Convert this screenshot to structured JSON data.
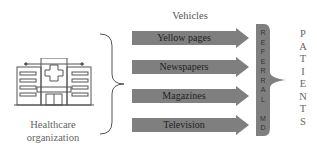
{
  "source": {
    "label_line1": "Healthcare",
    "label_line2": "organization",
    "icon": "hospital-icon",
    "sign_text": "HOSPITAL"
  },
  "vehicles": {
    "title": "Vehicles",
    "items": [
      {
        "label": "Yellow pages"
      },
      {
        "label": "Newspapers"
      },
      {
        "label": "Magazines"
      },
      {
        "label": "Television"
      }
    ],
    "arrow_color": "#7f7f7f"
  },
  "referral": {
    "letters": [
      "R",
      "E",
      "F",
      "E",
      "R",
      "R",
      "A",
      "L",
      "",
      "M",
      "D"
    ],
    "box_color": "#7f7f7f"
  },
  "target": {
    "letters": [
      "P",
      "A",
      "T",
      "I",
      "E",
      "N",
      "T",
      "S"
    ]
  }
}
